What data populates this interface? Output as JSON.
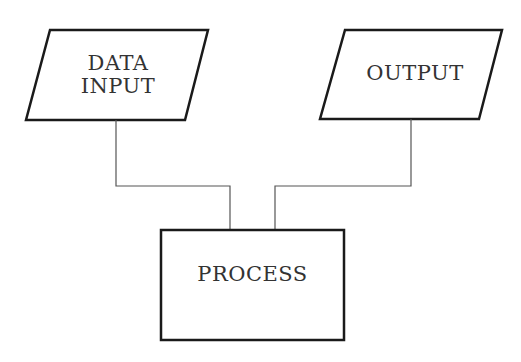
{
  "diagram": {
    "type": "flowchart",
    "nodes": [
      {
        "id": "data_input",
        "shape": "parallelogram",
        "label_lines": [
          "DATA",
          "INPUT"
        ]
      },
      {
        "id": "output",
        "shape": "parallelogram",
        "label": "OUTPUT"
      },
      {
        "id": "process",
        "shape": "rectangle",
        "label": "PROCESS"
      }
    ],
    "edges": [
      {
        "from": "data_input",
        "to": "process"
      },
      {
        "from": "output",
        "to": "process"
      }
    ],
    "colors": {
      "stroke": "#1a1a1a",
      "connector": "#555555",
      "text": "#333333",
      "background": "#ffffff"
    }
  }
}
